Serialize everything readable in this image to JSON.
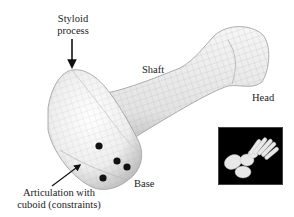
{
  "figure": {
    "labels": {
      "styloid": "Styloid\nprocess",
      "styloid_line1": "Styloid",
      "styloid_line2": "process",
      "shaft": "Shaft",
      "head": "Head",
      "base": "Base",
      "articulation_line1": "Articulation with",
      "articulation_line2": "cuboid (constraints)"
    },
    "constraint_points": [
      {
        "x": 99,
        "y": 146
      },
      {
        "x": 117,
        "y": 161
      },
      {
        "x": 127,
        "y": 167
      },
      {
        "x": 103,
        "y": 178
      }
    ],
    "inset": {
      "description": "Foot skeleton reference image",
      "background": "#000000"
    },
    "colors": {
      "bone_fill": "#f2f2f2",
      "bone_shade": "#bdbdbd",
      "mesh_line": "#a8a8a8",
      "marker": "#111111",
      "text": "#222222",
      "arrow": "#111111"
    }
  }
}
